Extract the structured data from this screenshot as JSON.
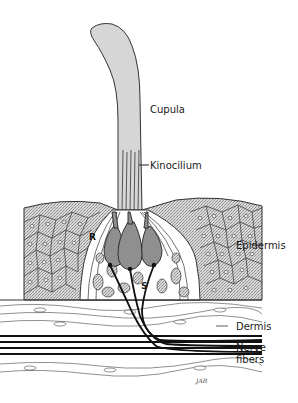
{
  "figure": {
    "labels": {
      "cupula": "Cupula",
      "kinocilium": "Kinocilium",
      "epidermis": "Epidermis",
      "dermis": "Dermis",
      "nerve_fibers_line1": "Nerve",
      "nerve_fibers_line2": "fibers",
      "receptor_cell": "R",
      "supporting_cell": "S"
    },
    "signature": "JAR",
    "colors": {
      "background": "#ffffff",
      "cupula_fill": "#d4d4d4",
      "epidermis_fill": "#bdbdbd",
      "hair_cell_fill": "#8f8f8f",
      "line": "#1a1a1a",
      "nerve": "#111111"
    }
  }
}
